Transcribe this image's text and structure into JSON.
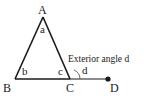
{
  "diagram": {
    "vertices": {
      "A": {
        "label": "A",
        "x": 43,
        "y": 17
      },
      "B": {
        "label": "B",
        "x": 15,
        "y": 79
      },
      "C": {
        "label": "C",
        "x": 70,
        "y": 79
      },
      "D": {
        "label": "D",
        "x": 108,
        "y": 79
      }
    },
    "angles": {
      "a": "a",
      "b": "b",
      "c": "c",
      "d": "d"
    },
    "annotation": "Exterior angle d",
    "colors": {
      "line": "#1a1a1a",
      "background": "#ffffff"
    }
  }
}
